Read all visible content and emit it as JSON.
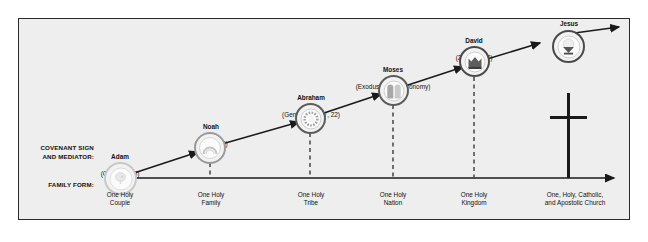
{
  "diagram": {
    "frame_background": "#eeeeee",
    "border_color": "#2b2b2b",
    "row_labels": {
      "covenant": "COVENANT SIGN\nAND MEDIATOR:",
      "family": "FAMILY FORM:"
    },
    "nodes": [
      {
        "id": "adam",
        "name": "Adam",
        "reference": "(Genesis 1-3)",
        "family_form": "One Holy\nCouple",
        "icon": "tree-icon",
        "has_dashed_connector": false
      },
      {
        "id": "noah",
        "name": "Noah",
        "reference": "(Genesis 9)",
        "family_form": "One Holy\nFamily",
        "icon": "rainbow-icon",
        "has_dashed_connector": true
      },
      {
        "id": "abraham",
        "name": "Abraham",
        "reference": "(Genesis 15, 17, 22)",
        "family_form": "One Holy\nTribe",
        "icon": "circumcision-knife-icon",
        "has_dashed_connector": true
      },
      {
        "id": "moses",
        "name": "Moses",
        "reference": "(Exodus 24/Deuteronomy)",
        "family_form": "One Holy\nNation",
        "icon": "stone-tablets-icon",
        "has_dashed_connector": true
      },
      {
        "id": "david",
        "name": "David",
        "reference": "(2 Samuel 7)",
        "family_form": "One Holy\nKingdom",
        "icon": "crown-icon",
        "has_dashed_connector": true
      },
      {
        "id": "jesus",
        "name": "Jesus",
        "reference": "(Mark 14)",
        "family_form": "One, Holy, Catholic,\nand Apostolic Church",
        "icon": "chalice-icon",
        "has_dashed_connector": false
      }
    ],
    "cross": {
      "icon": "cross-icon",
      "color": "#1a1a1a"
    },
    "axes": {
      "diagonal_arrow": "ascending-timeline-arrow",
      "horizontal_arrow": "family-form-baseline-arrow",
      "line_color": "#1a1a1a"
    }
  }
}
